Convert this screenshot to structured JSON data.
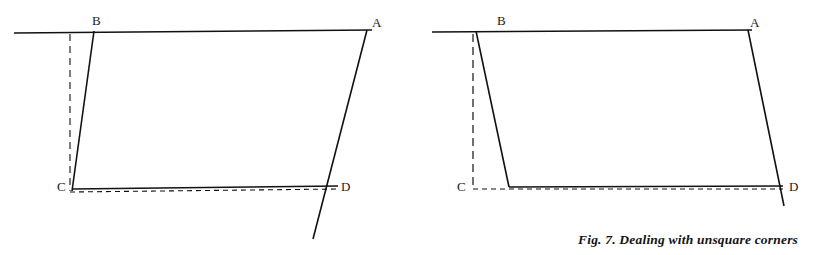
{
  "figure": {
    "caption": "Fig. 7. Dealing with unsquare corners",
    "stroke_color": "#111111",
    "background_color": "#ffffff",
    "panels": [
      {
        "id": "left-panel",
        "labels": [
          {
            "text": "B",
            "x": 92,
            "y": 14
          },
          {
            "text": "A",
            "x": 372,
            "y": 16
          },
          {
            "text": "C",
            "x": 57,
            "y": 180
          },
          {
            "text": "D",
            "x": 341,
            "y": 180
          }
        ],
        "solid_lines": [
          {
            "name": "top-reference-line",
            "x1": 14,
            "y1": 33,
            "x2": 372,
            "y2": 30
          },
          {
            "name": "side-BC-line",
            "x1": 94,
            "y1": 32,
            "x2": 72,
            "y2": 191
          },
          {
            "name": "side-AD-overrun-line",
            "x1": 367,
            "y1": 30,
            "x2": 313,
            "y2": 239
          },
          {
            "name": "bottom-CD-line",
            "x1": 72,
            "y1": 189,
            "x2": 337,
            "y2": 186
          }
        ],
        "dashed_lines": [
          {
            "name": "vertical-guide-line",
            "x1": 70,
            "y1": 34,
            "x2": 70,
            "y2": 190
          },
          {
            "name": "bottom-guide-line",
            "x1": 70,
            "y1": 193,
            "x2": 337,
            "y2": 190
          }
        ]
      },
      {
        "id": "right-panel",
        "labels": [
          {
            "text": "B",
            "x": 497,
            "y": 14
          },
          {
            "text": "A",
            "x": 750,
            "y": 16
          },
          {
            "text": "C",
            "x": 457,
            "y": 180
          },
          {
            "text": "D",
            "x": 789,
            "y": 180
          }
        ],
        "solid_lines": [
          {
            "name": "top-reference-line",
            "x1": 432,
            "y1": 32,
            "x2": 752,
            "y2": 30
          },
          {
            "name": "side-BC-line",
            "x1": 476,
            "y1": 32,
            "x2": 509,
            "y2": 187
          },
          {
            "name": "side-AD-line",
            "x1": 748,
            "y1": 30,
            "x2": 784,
            "y2": 205
          },
          {
            "name": "bottom-CD-line",
            "x1": 509,
            "y1": 187,
            "x2": 783,
            "y2": 186
          }
        ],
        "dashed_lines": [
          {
            "name": "vertical-guide-line",
            "x1": 473,
            "y1": 34,
            "x2": 473,
            "y2": 189
          },
          {
            "name": "bottom-guide-line",
            "x1": 473,
            "y1": 189,
            "x2": 783,
            "y2": 189
          }
        ]
      }
    ]
  }
}
